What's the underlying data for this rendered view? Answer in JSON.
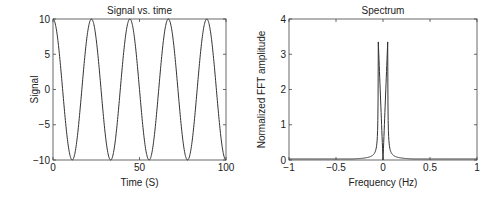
{
  "chart_data": [
    {
      "type": "line",
      "title": "Signal vs. time",
      "xlabel": "Time (S)",
      "ylabel": "Signal",
      "xlim": [
        0,
        100
      ],
      "ylim": [
        -10,
        10
      ],
      "xticks": [
        "0",
        "50",
        "100"
      ],
      "yticks": [
        "10",
        "5",
        "0",
        "−5",
        "−10"
      ],
      "series": [
        {
          "name": "signal",
          "function": "10*cos(2*pi*0.045*t)",
          "amplitude": 10,
          "frequency_hz": 0.045
        }
      ],
      "grid": false
    },
    {
      "type": "line",
      "title": "Spectrum",
      "xlabel": "Frequency (Hz)",
      "ylabel": "Normalized FFT amplitude",
      "xlim": [
        -1,
        1
      ],
      "ylim": [
        0,
        4
      ],
      "xticks": [
        "−1",
        "−0.5",
        "0",
        "0.5",
        "1"
      ],
      "yticks": [
        "4",
        "3",
        "2",
        "1",
        "0"
      ],
      "series": [
        {
          "name": "spectrum",
          "peaks": [
            {
              "x": -0.05,
              "y": 3.35
            },
            {
              "x": 0.05,
              "y": 3.35
            }
          ],
          "min_at_zero": 0
        }
      ],
      "grid": false
    }
  ]
}
